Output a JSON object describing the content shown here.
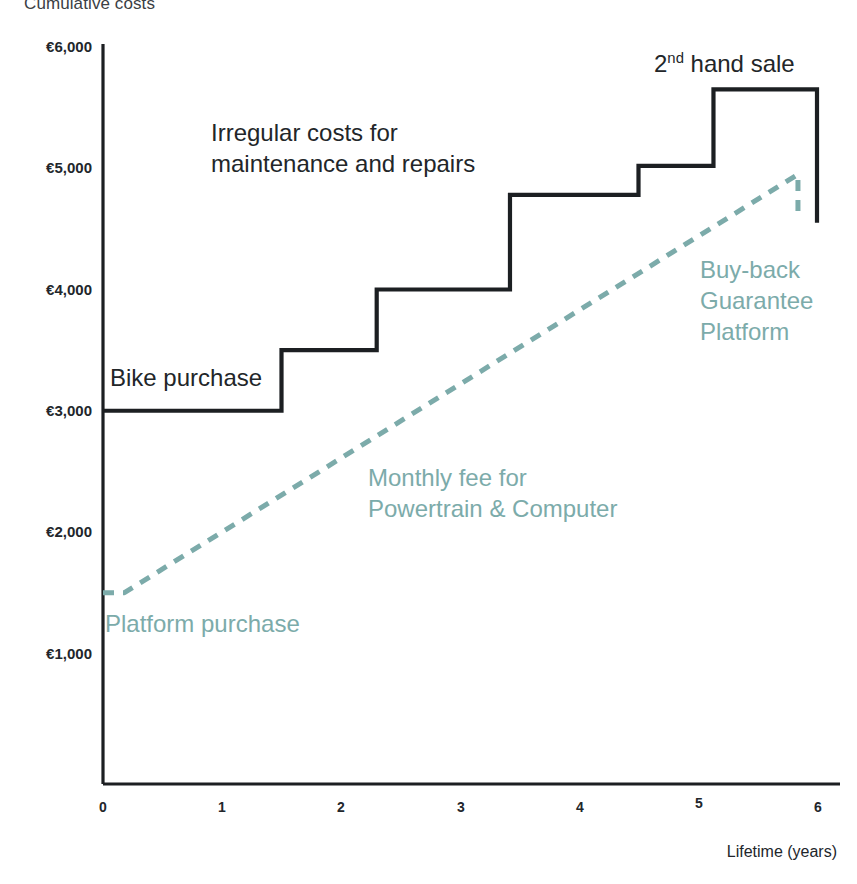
{
  "chart_data": {
    "type": "line",
    "title": "Cumulative costs",
    "xlabel": "Lifetime (years)",
    "ylabel": "Cumulative costs",
    "xlim": [
      0,
      6
    ],
    "ylim": [
      0,
      6000
    ],
    "grid": false,
    "legend_position": "inline-annotations",
    "xticks": [
      "0",
      "1",
      "2",
      "3",
      "4",
      "5",
      "6"
    ],
    "xtick_values": [
      0,
      1,
      2,
      3,
      4,
      5,
      6
    ],
    "yticks": [
      "€1,000",
      "€2,000",
      "€3,000",
      "€4,000",
      "€5,000",
      "€6,000"
    ],
    "ytick_values": [
      1000,
      2000,
      3000,
      4000,
      5000,
      6000
    ],
    "currency_symbol": "€",
    "series": [
      {
        "name": "Bike ownership (step)",
        "style": "step-solid",
        "color": "#1c1f22",
        "points": [
          {
            "x": 0.0,
            "y": 3000
          },
          {
            "x": 1.5,
            "y": 3000
          },
          {
            "x": 1.5,
            "y": 3500
          },
          {
            "x": 2.3,
            "y": 3500
          },
          {
            "x": 2.3,
            "y": 4000
          },
          {
            "x": 3.42,
            "y": 4000
          },
          {
            "x": 3.42,
            "y": 4780
          },
          {
            "x": 4.5,
            "y": 4780
          },
          {
            "x": 4.5,
            "y": 5020
          },
          {
            "x": 5.13,
            "y": 5020
          },
          {
            "x": 5.13,
            "y": 5650
          },
          {
            "x": 6.0,
            "y": 5650
          },
          {
            "x": 6.0,
            "y": 4550
          }
        ]
      },
      {
        "name": "Buy-back Guarantee Platform (dashed)",
        "style": "dashed",
        "color": "#7cabaa",
        "points": [
          {
            "x": 0.0,
            "y": 1500
          },
          {
            "x": 0.18,
            "y": 1500
          },
          {
            "x": 5.84,
            "y": 4950
          },
          {
            "x": 5.84,
            "y": 4600
          }
        ]
      }
    ],
    "annotations": [
      {
        "id": "bike-purchase",
        "text": "Bike purchase",
        "color": "#222629",
        "x_px": 110,
        "y_px": 362
      },
      {
        "id": "irregular-costs",
        "text": "Irregular costs for\nmaintenance and repairs",
        "color": "#222629",
        "x_px": 211,
        "y_px": 117
      },
      {
        "id": "second-hand-sale",
        "text_prefix": "2",
        "text_sup": "nd",
        "text_suffix": " hand sale",
        "text": "2nd hand sale",
        "color": "#222629",
        "x_px": 654,
        "y_px": 48
      },
      {
        "id": "buy-back-platform",
        "text": "Buy-back\nGuarantee\nPlatform",
        "color": "#7cabaa",
        "x_px": 700,
        "y_px": 254
      },
      {
        "id": "monthly-fee",
        "text": "Monthly fee for\nPowertrain & Computer",
        "color": "#7cabaa",
        "x_px": 368,
        "y_px": 462
      },
      {
        "id": "platform-purchase",
        "text": "Platform purchase",
        "color": "#7cabaa",
        "x_px": 105,
        "y_px": 608
      }
    ]
  },
  "colors": {
    "axis": "#1c1f22",
    "step_line": "#1c1f22",
    "dashed_line": "#7cabaa",
    "teal_text": "#7cabaa",
    "dark_text": "#222629",
    "background": "#ffffff"
  }
}
